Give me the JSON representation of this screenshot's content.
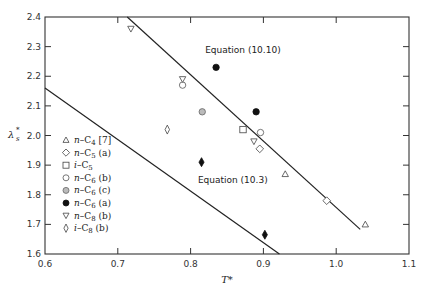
{
  "chart_data": {
    "type": "scatter",
    "title": "",
    "xlabel": "T*",
    "ylabel": "λs*",
    "xlim": [
      0.6,
      1.1
    ],
    "ylim": [
      1.6,
      2.4
    ],
    "x_ticks": [
      "0.6",
      "0.7",
      "0.8",
      "0.9",
      "1.0",
      "1.1"
    ],
    "y_ticks": [
      "1.6",
      "1.7",
      "1.8",
      "1.9",
      "2.0",
      "2.1",
      "2.2",
      "2.3",
      "2.4"
    ],
    "grid": false,
    "legend_position": "inside-left",
    "series": [
      {
        "name": "n-C4 [7]",
        "marker": "triangle-open",
        "points": [
          [
            0.93,
            1.87
          ],
          [
            1.04,
            1.7
          ]
        ]
      },
      {
        "name": "n-C5 (a)",
        "marker": "diamond-open",
        "points": [
          [
            0.895,
            1.955
          ],
          [
            0.987,
            1.78
          ]
        ]
      },
      {
        "name": "i-C5",
        "marker": "square-open",
        "points": [
          [
            0.872,
            2.02
          ]
        ]
      },
      {
        "name": "n-C6 (b)",
        "marker": "circle-open",
        "points": [
          [
            0.789,
            2.17
          ],
          [
            0.896,
            2.01
          ]
        ]
      },
      {
        "name": "n-C6 (c)",
        "marker": "circle-gray",
        "points": [
          [
            0.816,
            2.08
          ]
        ]
      },
      {
        "name": "n-C6 (a)",
        "marker": "circle-filled",
        "points": [
          [
            0.835,
            2.23
          ],
          [
            0.89,
            2.08
          ]
        ]
      },
      {
        "name": "n-C8 (b)",
        "marker": "triangle-down-open",
        "points": [
          [
            0.718,
            2.36
          ],
          [
            0.789,
            2.19
          ],
          [
            0.887,
            1.98
          ]
        ]
      },
      {
        "name": "i-C8 (b)",
        "marker": "thin-diamond-open",
        "points": [
          [
            0.768,
            2.02
          ]
        ]
      },
      {
        "name": "i-C8 (filled)",
        "marker": "thin-diamond-filled",
        "points": [
          [
            0.815,
            1.91
          ],
          [
            0.902,
            1.665
          ]
        ]
      }
    ],
    "lines": [
      {
        "name": "Equation (10.10)",
        "from": [
          0.713,
          2.4
        ],
        "to": [
          1.033,
          1.683
        ]
      },
      {
        "name": "Equation (10.3)",
        "from": [
          0.6,
          2.16
        ],
        "to": [
          0.922,
          1.6
        ]
      }
    ],
    "annotations": [
      {
        "text": "Equation (10.10)",
        "x": 0.82,
        "y": 2.28
      },
      {
        "text": "Equation (10.3)",
        "x": 0.81,
        "y": 1.84
      }
    ]
  },
  "labels": {
    "xlabel": "T*",
    "ylabel_main": "λ",
    "ylabel_sub": "s",
    "ylabel_sup": "*",
    "eq1": "Equation (10.10)",
    "eq2": "Equation (10.3)"
  },
  "legend": [
    {
      "pre": "n",
      "rest": "–C",
      "sub": "4",
      "post": " [7]"
    },
    {
      "pre": "n",
      "rest": "–C",
      "sub": "5",
      "post": " (a)"
    },
    {
      "pre": "i",
      "rest": "–C",
      "sub": "5",
      "post": ""
    },
    {
      "pre": "n",
      "rest": "–C",
      "sub": "6",
      "post": " (b)"
    },
    {
      "pre": "n",
      "rest": "–C",
      "sub": "6",
      "post": " (c)"
    },
    {
      "pre": "n",
      "rest": "–C",
      "sub": "6",
      "post": " (a)"
    },
    {
      "pre": "n",
      "rest": "–C",
      "sub": "8",
      "post": " (b)"
    },
    {
      "pre": "i",
      "rest": "–C",
      "sub": "8",
      "post": " (b)"
    }
  ]
}
